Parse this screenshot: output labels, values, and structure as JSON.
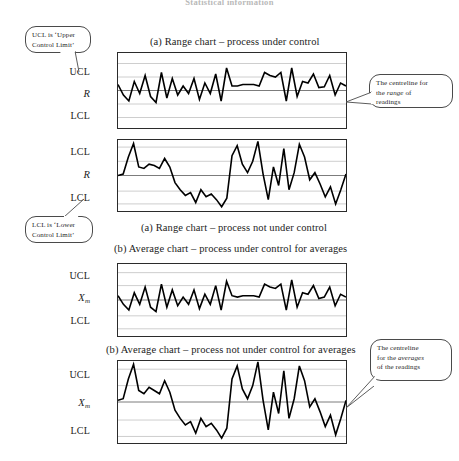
{
  "header": {
    "text": "Statistical information"
  },
  "captions": {
    "chart1": "(a) Range chart – process under control",
    "chart2": "(a) Range chart – process not under control",
    "chart3": "(b) Average chart – process under control for averages",
    "chart4": "(b) Average chart – process not under control for averages"
  },
  "callouts": {
    "upper_control_limit": {
      "line1": "UCL is ‘Upper",
      "line2": "Control Limit’"
    },
    "range_centreline": {
      "line1": "The centreline for",
      "line2_pre": "the ",
      "line2_em": "range",
      "line2_post": " of",
      "line3": "readings"
    },
    "lower_control_limit": {
      "line1": "LCL is ‘Lower",
      "line2": "Control Limit’"
    },
    "average_centreline": {
      "line1": "The centreline",
      "line2_pre": "for the ",
      "line2_em": "averages",
      "line3": "of the readings"
    }
  },
  "charts": [
    {
      "id": "range-under-control",
      "axis_labels": {
        "upper": "UCL",
        "centre": "R",
        "centre_subscript": "",
        "lower": "LCL"
      },
      "chart_data": {
        "type": "line",
        "title": "(a) Range chart – process under control",
        "xlabel": "",
        "ylabel": "R",
        "ylim": [
          0,
          1
        ],
        "grid": true,
        "gridlines": [
          0.14,
          0.32,
          0.5,
          0.68,
          0.86
        ],
        "centreline": 0.5,
        "upper_limit": 0.32,
        "lower_limit": 0.68,
        "legend": "none",
        "values": [
          0.58,
          0.44,
          0.36,
          0.62,
          0.46,
          0.7,
          0.42,
          0.34,
          0.74,
          0.4,
          0.66,
          0.44,
          0.56,
          0.46,
          0.66,
          0.38,
          0.6,
          0.46,
          0.72,
          0.36,
          0.8,
          0.56,
          0.56,
          0.58,
          0.58,
          0.58,
          0.56,
          0.74,
          0.7,
          0.68,
          0.74,
          0.36,
          0.8,
          0.42,
          0.62,
          0.6,
          0.72,
          0.54,
          0.55,
          0.7,
          0.44,
          0.6,
          0.56
        ]
      }
    },
    {
      "id": "range-not-under-control",
      "axis_labels": {
        "upper": "LCL",
        "centre": "R",
        "centre_subscript": "",
        "lower": "LCL"
      },
      "chart_data": {
        "type": "line",
        "title": "(a) Range chart – process not under control",
        "xlabel": "",
        "ylabel": "R",
        "ylim": [
          0,
          1
        ],
        "grid": true,
        "gridlines": [
          0.1,
          0.3,
          0.5,
          0.72,
          0.9
        ],
        "centreline": 0.5,
        "upper_limit": 0.3,
        "lower_limit": 0.72,
        "legend": "none",
        "values": [
          0.5,
          0.52,
          0.76,
          0.95,
          0.62,
          0.6,
          0.66,
          0.64,
          0.6,
          0.74,
          0.62,
          0.4,
          0.3,
          0.22,
          0.26,
          0.12,
          0.3,
          0.2,
          0.24,
          0.16,
          0.06,
          0.18,
          0.78,
          0.92,
          0.66,
          0.54,
          0.7,
          0.98,
          0.52,
          0.16,
          0.62,
          0.36,
          0.88,
          0.3,
          0.54,
          0.94,
          0.76,
          0.44,
          0.54,
          0.38,
          0.2,
          0.34,
          0.1,
          0.3,
          0.52
        ]
      }
    },
    {
      "id": "average-under-control",
      "axis_labels": {
        "upper": "UCL",
        "centre": "X",
        "centre_subscript": "m",
        "lower": "LCL"
      },
      "chart_data": {
        "type": "line",
        "title": "(b) Average chart – process under control for averages",
        "xlabel": "",
        "ylabel": "Xm",
        "ylim": [
          0,
          1
        ],
        "grid": true,
        "gridlines": [
          0.12,
          0.3,
          0.5,
          0.72,
          0.9
        ],
        "centreline": 0.5,
        "upper_limit": 0.3,
        "lower_limit": 0.72,
        "legend": "none",
        "values": [
          0.56,
          0.44,
          0.36,
          0.6,
          0.44,
          0.68,
          0.4,
          0.34,
          0.72,
          0.4,
          0.64,
          0.42,
          0.54,
          0.44,
          0.64,
          0.38,
          0.58,
          0.44,
          0.7,
          0.36,
          0.76,
          0.56,
          0.54,
          0.56,
          0.56,
          0.56,
          0.54,
          0.72,
          0.68,
          0.66,
          0.72,
          0.36,
          0.78,
          0.4,
          0.6,
          0.58,
          0.7,
          0.52,
          0.54,
          0.68,
          0.42,
          0.58,
          0.54
        ]
      }
    },
    {
      "id": "average-not-under-control",
      "axis_labels": {
        "upper": "UCL",
        "centre": "X",
        "centre_subscript": "m",
        "lower": "LCL"
      },
      "chart_data": {
        "type": "line",
        "title": "(b) Average chart – process not under control for averages",
        "xlabel": "",
        "ylabel": "Xm",
        "ylim": [
          0,
          1
        ],
        "grid": true,
        "gridlines": [
          0.1,
          0.3,
          0.5,
          0.72,
          0.92
        ],
        "centreline": 0.5,
        "upper_limit": 0.3,
        "lower_limit": 0.72,
        "legend": "none",
        "values": [
          0.52,
          0.54,
          0.78,
          0.96,
          0.64,
          0.6,
          0.68,
          0.64,
          0.6,
          0.76,
          0.62,
          0.4,
          0.3,
          0.22,
          0.26,
          0.12,
          0.3,
          0.2,
          0.24,
          0.16,
          0.06,
          0.18,
          0.78,
          0.94,
          0.66,
          0.54,
          0.7,
          0.99,
          0.52,
          0.16,
          0.62,
          0.36,
          0.88,
          0.3,
          0.54,
          0.94,
          0.76,
          0.44,
          0.54,
          0.38,
          0.2,
          0.34,
          0.1,
          0.3,
          0.52
        ]
      }
    }
  ]
}
